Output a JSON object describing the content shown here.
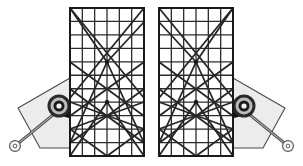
{
  "figure": {
    "background_color": "#ffffff",
    "width": 303,
    "height": 166,
    "assembly_count": 2,
    "symmetry": "left-right mirror about vertical centerline x=151.5"
  },
  "colors": {
    "background": "#ffffff",
    "grid_line": "#2b2b2b",
    "grid_border": "#1a1a1a",
    "diagonal_brace": "#262626",
    "panel_fill": "#ffffff",
    "plate_fill": "#ececec",
    "plate_stroke": "#4a4a4a",
    "rod_fill": "#fbfbfb",
    "rod_stroke": "#555555",
    "hub_outer": "#2a2a2a",
    "hub_ring_light": "#bdbdbd",
    "hub_ring_dark": "#1c1c1c",
    "hub_center": "#f2f2f2",
    "hub_block": "#111111",
    "eyelet_stroke": "#555555",
    "eyelet_hole": "#ffffff"
  },
  "panel_geometry": {
    "columns": 6,
    "rows": 11,
    "left_panel": {
      "x": 70,
      "y": 8,
      "width": 74,
      "height": 148
    },
    "right_panel": {
      "x": 159,
      "y": 8,
      "width": 74,
      "height": 148
    },
    "cell_width": 12.33,
    "cell_height": 13.45,
    "border_stroke_width": 2.0,
    "grid_stroke_width": 1.3
  },
  "plate_geometry": {
    "label": "quadrilateral mounting plate",
    "left_points": "18,108 70,78 70,148 40,148",
    "right_points": "285,108 233,78 233,148 263,148",
    "fill": "#ececec",
    "stroke_width": 1.1
  },
  "hub": {
    "label": "pivot bearing hub",
    "left_center": {
      "cx": 59,
      "cy": 106
    },
    "right_center": {
      "cx": 244,
      "cy": 106
    },
    "radii": [
      11.5,
      8.5,
      5.5,
      2.6
    ],
    "block_width": 11,
    "block_height": 11
  },
  "rod": {
    "label": "connecting rod arm",
    "left_pivot": {
      "x": 59,
      "y": 110
    },
    "left_eyelet": {
      "x": 15,
      "y": 146
    },
    "right_pivot": {
      "x": 244,
      "y": 110
    },
    "right_eyelet": {
      "x": 288,
      "y": 146
    },
    "half_width": 5.2,
    "eyelet_outer_r": 5.4,
    "eyelet_hole_r": 1.9
  },
  "braces": {
    "description": "Diagonal bracing members drawn across each grid panel, converging at nodes",
    "left_lines": [
      {
        "x1": 70,
        "y1": 8,
        "x2": 144,
        "y2": 98,
        "name": "brace-tl-to-mr"
      },
      {
        "x1": 144,
        "y1": 8,
        "x2": 70,
        "y2": 98,
        "name": "brace-tr-to-ml"
      },
      {
        "x1": 70,
        "y1": 8,
        "x2": 107,
        "y2": 62,
        "name": "brace-tl-short"
      },
      {
        "x1": 144,
        "y1": 22,
        "x2": 107,
        "y2": 62,
        "name": "brace-tr-short"
      },
      {
        "x1": 70,
        "y1": 62,
        "x2": 144,
        "y2": 116,
        "name": "brace-ml-to-lr"
      },
      {
        "x1": 144,
        "y1": 62,
        "x2": 70,
        "y2": 116,
        "name": "brace-mr-to-ll"
      },
      {
        "x1": 70,
        "y1": 89,
        "x2": 144,
        "y2": 143,
        "name": "brace-lower-a"
      },
      {
        "x1": 144,
        "y1": 89,
        "x2": 70,
        "y2": 143,
        "name": "brace-lower-b"
      },
      {
        "x1": 70,
        "y1": 102,
        "x2": 144,
        "y2": 129,
        "name": "brace-shallow-a"
      },
      {
        "x1": 144,
        "y1": 102,
        "x2": 70,
        "y2": 129,
        "name": "brace-shallow-b"
      },
      {
        "x1": 107,
        "y1": 62,
        "x2": 70,
        "y2": 143,
        "name": "brace-node-to-ll"
      },
      {
        "x1": 107,
        "y1": 62,
        "x2": 144,
        "y2": 143,
        "name": "brace-node-to-lr"
      },
      {
        "x1": 107,
        "y1": 102,
        "x2": 70,
        "y2": 156,
        "name": "brace-mid-to-bl"
      },
      {
        "x1": 107,
        "y1": 102,
        "x2": 144,
        "y2": 156,
        "name": "brace-mid-to-br"
      },
      {
        "x1": 70,
        "y1": 129,
        "x2": 107,
        "y2": 156,
        "name": "brace-bottom-a"
      },
      {
        "x1": 144,
        "y1": 129,
        "x2": 107,
        "y2": 156,
        "name": "brace-bottom-b"
      }
    ]
  },
  "nodes": {
    "description": "Heavy junction points where multiple braces converge",
    "left": [
      {
        "x": 107,
        "y": 62,
        "r": 2.2,
        "name": "node-upper-convergence"
      },
      {
        "x": 107,
        "y": 102,
        "r": 2.2,
        "name": "node-lower-convergence"
      }
    ]
  }
}
